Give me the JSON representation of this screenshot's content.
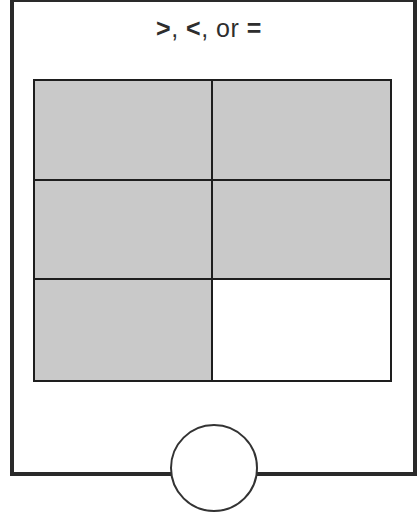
{
  "title": {
    "parts": [
      ">",
      ", ",
      "<",
      ", or ",
      "="
    ]
  },
  "fraction_model": {
    "rows": 3,
    "columns": 2,
    "total_parts": 6,
    "shaded_parts": 5,
    "cells": [
      {
        "shaded": true
      },
      {
        "shaded": true
      },
      {
        "shaded": true
      },
      {
        "shaded": true
      },
      {
        "shaded": true
      },
      {
        "shaded": false
      }
    ],
    "shade_color": "#c9c9c9",
    "line_color": "#1e1e1e"
  },
  "answer_circle": {
    "content": ""
  }
}
